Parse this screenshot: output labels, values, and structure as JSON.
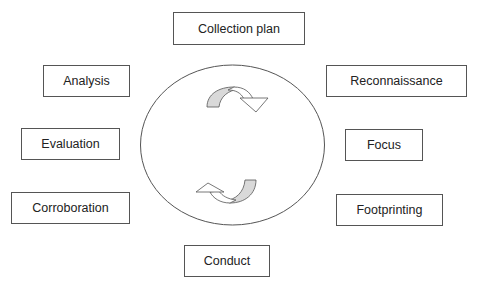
{
  "diagram": {
    "type": "cycle",
    "center": {
      "shape": "ellipse",
      "arrows": [
        {
          "name": "top-cycle-arrow",
          "direction": "clockwise"
        },
        {
          "name": "bottom-cycle-arrow",
          "direction": "clockwise"
        }
      ]
    },
    "colors": {
      "stroke": "#555555",
      "arrow_fill": "#d9d9d9",
      "text": "#222222",
      "background": "#ffffff"
    },
    "nodes": [
      {
        "id": "collection-plan",
        "label": "Collection plan",
        "position": "top"
      },
      {
        "id": "reconnaissance",
        "label": "Reconnaissance",
        "position": "upper-right"
      },
      {
        "id": "focus",
        "label": "Focus",
        "position": "right"
      },
      {
        "id": "footprinting",
        "label": "Footprinting",
        "position": "lower-right"
      },
      {
        "id": "conduct",
        "label": "Conduct",
        "position": "bottom"
      },
      {
        "id": "corroboration",
        "label": "Corroboration",
        "position": "lower-left"
      },
      {
        "id": "evaluation",
        "label": "Evaluation",
        "position": "left"
      },
      {
        "id": "analysis",
        "label": "Analysis",
        "position": "upper-left"
      }
    ]
  }
}
